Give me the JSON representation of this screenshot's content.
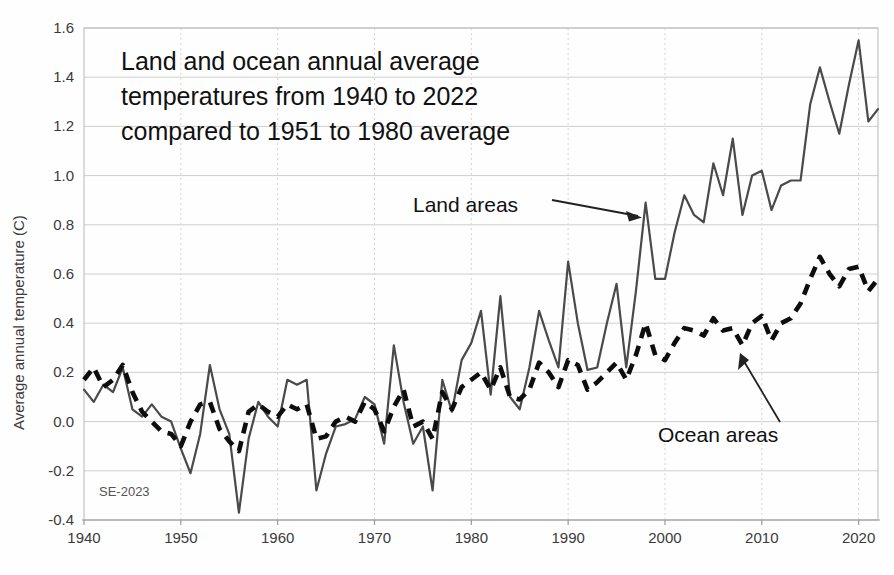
{
  "chart_data": {
    "type": "line",
    "title": "Land and ocean annual average temperatures from 1940 to 2022 compared to 1951 to 1980 average",
    "title_lines": [
      "Land and ocean annual average",
      "temperatures from 1940 to 2022",
      "compared to 1951 to 1980 average"
    ],
    "xlabel": "",
    "ylabel": "Average annual temperature (C)",
    "xlim": [
      1940,
      2022
    ],
    "ylim": [
      -0.4,
      1.6
    ],
    "xticks": [
      1940,
      1950,
      1960,
      1970,
      1980,
      1990,
      2000,
      2010,
      2020
    ],
    "yticks": [
      -0.4,
      -0.2,
      0.0,
      0.2,
      0.4,
      0.6,
      0.8,
      1.0,
      1.2,
      1.4,
      1.6
    ],
    "xtick_labels": [
      "1940",
      "1950",
      "1960",
      "1970",
      "1980",
      "1990",
      "2000",
      "2010",
      "2020"
    ],
    "ytick_labels": [
      "-0.4",
      "-0.2",
      "0.0",
      "0.2",
      "0.4",
      "0.6",
      "0.8",
      "1.0",
      "1.2",
      "1.4",
      "1.6"
    ],
    "grid": true,
    "grid_axis": "both",
    "legend": "annotations",
    "watermark": "SE-2023",
    "annotations": [
      {
        "text": "Land areas",
        "target_series": "Land areas",
        "arrow": "right"
      },
      {
        "text": "Ocean areas",
        "target_series": "Ocean areas",
        "arrow": "up-left"
      }
    ],
    "x": [
      1940,
      1941,
      1942,
      1943,
      1944,
      1945,
      1946,
      1947,
      1948,
      1949,
      1950,
      1951,
      1952,
      1953,
      1954,
      1955,
      1956,
      1957,
      1958,
      1959,
      1960,
      1961,
      1962,
      1963,
      1964,
      1965,
      1966,
      1967,
      1968,
      1969,
      1970,
      1971,
      1972,
      1973,
      1974,
      1975,
      1976,
      1977,
      1978,
      1979,
      1980,
      1981,
      1982,
      1983,
      1984,
      1985,
      1986,
      1987,
      1988,
      1989,
      1990,
      1991,
      1992,
      1993,
      1994,
      1995,
      1996,
      1997,
      1998,
      1999,
      2000,
      2001,
      2002,
      2003,
      2004,
      2005,
      2006,
      2007,
      2008,
      2009,
      2010,
      2011,
      2012,
      2013,
      2014,
      2015,
      2016,
      2017,
      2018,
      2019,
      2020,
      2021,
      2022
    ],
    "series": [
      {
        "name": "Land areas",
        "style": "solid",
        "color": "#4a4a4a",
        "values": [
          0.13,
          0.08,
          0.15,
          0.12,
          0.22,
          0.05,
          0.02,
          0.07,
          0.02,
          0.0,
          -0.11,
          -0.21,
          -0.05,
          0.23,
          0.05,
          -0.05,
          -0.37,
          -0.07,
          0.08,
          0.02,
          -0.02,
          0.17,
          0.15,
          0.17,
          -0.28,
          -0.13,
          -0.02,
          -0.01,
          0.01,
          0.1,
          0.07,
          -0.09,
          0.31,
          0.08,
          -0.09,
          -0.02,
          -0.28,
          0.17,
          0.04,
          0.25,
          0.32,
          0.45,
          0.11,
          0.51,
          0.1,
          0.05,
          0.22,
          0.45,
          0.33,
          0.22,
          0.65,
          0.4,
          0.21,
          0.22,
          0.4,
          0.56,
          0.22,
          0.53,
          0.89,
          0.58,
          0.58,
          0.77,
          0.92,
          0.84,
          0.81,
          1.05,
          0.92,
          1.15,
          0.84,
          1.0,
          1.02,
          0.86,
          0.96,
          0.98,
          0.98,
          1.29,
          1.44,
          1.3,
          1.17,
          1.37,
          1.55,
          1.22,
          1.27
        ]
      },
      {
        "name": "Ocean areas",
        "style": "dashed",
        "color": "#0d0d0d",
        "values": [
          0.17,
          0.22,
          0.14,
          0.17,
          0.23,
          0.12,
          0.04,
          0.0,
          -0.04,
          -0.05,
          -0.1,
          0.0,
          0.07,
          0.08,
          -0.03,
          -0.08,
          -0.12,
          0.04,
          0.07,
          0.04,
          0.02,
          0.07,
          0.05,
          0.07,
          -0.07,
          -0.06,
          0.0,
          0.02,
          0.0,
          0.08,
          0.05,
          -0.04,
          0.06,
          0.13,
          -0.02,
          0.0,
          -0.07,
          0.12,
          0.05,
          0.14,
          0.17,
          0.2,
          0.13,
          0.22,
          0.1,
          0.09,
          0.13,
          0.24,
          0.2,
          0.14,
          0.25,
          0.23,
          0.13,
          0.16,
          0.2,
          0.24,
          0.17,
          0.27,
          0.4,
          0.27,
          0.25,
          0.32,
          0.38,
          0.37,
          0.35,
          0.42,
          0.37,
          0.38,
          0.31,
          0.4,
          0.43,
          0.33,
          0.4,
          0.42,
          0.48,
          0.58,
          0.67,
          0.6,
          0.55,
          0.62,
          0.63,
          0.53,
          0.58
        ]
      }
    ]
  },
  "figure": {
    "plot_left": 84,
    "plot_right": 878,
    "plot_top": 28,
    "plot_bottom": 520
  }
}
